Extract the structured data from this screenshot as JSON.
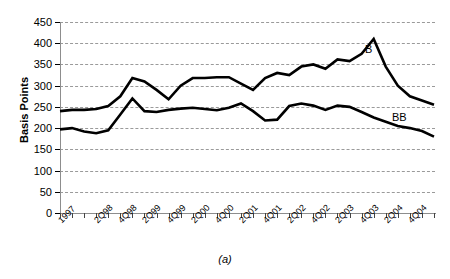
{
  "chart_data": {
    "type": "line",
    "title": "",
    "caption": "(a)",
    "xlabel": "",
    "ylabel": "Basis Points",
    "ylim": [
      0,
      450
    ],
    "ytick_step": 50,
    "yticks": [
      450,
      400,
      350,
      300,
      250,
      200,
      150,
      100,
      50,
      0
    ],
    "grid": true,
    "legend_position": "inline-right",
    "x": [
      "1Q97",
      "2Q97",
      "3Q97",
      "4Q97",
      "1Q98",
      "2Q98",
      "3Q98",
      "4Q98",
      "1Q99",
      "2Q99",
      "3Q99",
      "4Q99",
      "1Q00",
      "2Q00",
      "3Q00",
      "4Q00",
      "1Q01",
      "2Q01",
      "3Q01",
      "4Q01",
      "1Q02",
      "2Q02",
      "3Q02",
      "4Q02",
      "1Q03",
      "2Q03",
      "3Q03",
      "4Q03",
      "1Q04",
      "2Q04",
      "3Q04",
      "4Q04"
    ],
    "xtick_labels": [
      "1997",
      "2Q98",
      "4Q98",
      "2Q99",
      "4Q99",
      "2Q00",
      "4Q00",
      "2Q01",
      "4Q01",
      "2Q02",
      "4Q02",
      "2Q03",
      "4Q03",
      "2Q04",
      "4Q04"
    ],
    "series": [
      {
        "name": "B",
        "label": "B",
        "color": "#000000",
        "values": [
          240,
          243,
          243,
          245,
          252,
          275,
          318,
          310,
          290,
          268,
          300,
          318,
          318,
          320,
          320,
          305,
          290,
          318,
          330,
          325,
          345,
          350,
          340,
          362,
          358,
          375,
          410,
          345,
          300,
          275,
          265,
          255
        ]
      },
      {
        "name": "BB",
        "label": "BB",
        "color": "#000000",
        "values": [
          197,
          200,
          192,
          188,
          195,
          232,
          270,
          240,
          238,
          243,
          246,
          248,
          245,
          242,
          248,
          258,
          240,
          218,
          220,
          252,
          258,
          253,
          243,
          253,
          250,
          238,
          225,
          215,
          205,
          200,
          193,
          180
        ]
      }
    ]
  },
  "axis": {
    "ylabel": "Basis Points"
  }
}
